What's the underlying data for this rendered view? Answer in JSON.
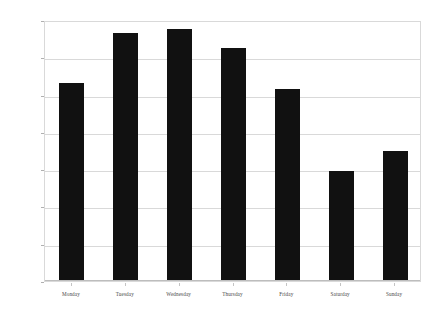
{
  "chart_data": {
    "type": "bar",
    "title": "",
    "subtitle": "",
    "xlabel": "",
    "ylabel": "",
    "categories": [
      "Monday",
      "Tuesday",
      "Wednesday",
      "Thursday",
      "Friday",
      "Saturday",
      "Sunday"
    ],
    "values": [
      265,
      332,
      338,
      313,
      258,
      147,
      175
    ],
    "series": [
      {
        "name": "",
        "values": [
          265,
          332,
          338,
          313,
          258,
          147,
          175
        ]
      }
    ],
    "ylim": [
      0,
      350
    ],
    "yticks": [
      0,
      50,
      100,
      150,
      200,
      250,
      300,
      350
    ],
    "ytick_labels": [
      "0",
      "50",
      "100",
      "150",
      "200",
      "250",
      "300",
      "350"
    ],
    "grid": true,
    "legend": false,
    "legend_position": "none",
    "bar_color": "#111111",
    "grid_color": "#d9d9d9",
    "axis_color": "#b8b8b8",
    "background_color": "#ffffff"
  }
}
